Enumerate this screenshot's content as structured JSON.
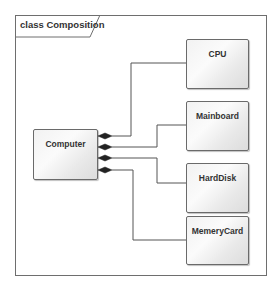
{
  "diagram": {
    "frame_title": "class Composition",
    "whole": {
      "name": "Computer"
    },
    "parts": [
      {
        "name": "CPU",
        "relation": "composition"
      },
      {
        "name": "Mainboard",
        "relation": "composition"
      },
      {
        "name": "HardDisk",
        "relation": "composition"
      },
      {
        "name": "MemeryCard",
        "relation": "composition"
      }
    ],
    "colors": {
      "border": "#6a6a6a",
      "line": "#555555",
      "diamond": "#222222"
    }
  }
}
